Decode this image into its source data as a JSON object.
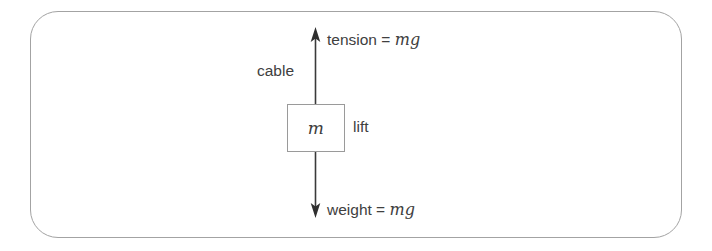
{
  "diagram": {
    "background_color": "#ffffff",
    "frame": {
      "stroke_color": "#a3a3a3",
      "corner_radius": 28
    },
    "body": {
      "shape": "rectangle",
      "mass_symbol": "m",
      "label": "lift",
      "border_color": "#9a9a9a",
      "fill_color": "#ffffff"
    },
    "cable": {
      "label": "cable",
      "line_color": "#3a3a3a"
    },
    "forces": [
      {
        "name": "tension",
        "direction": "up",
        "label": "tension = ",
        "magnitude": "mg",
        "arrow_color": "#3a3a3a"
      },
      {
        "name": "weight",
        "direction": "down",
        "label": "weight = ",
        "magnitude": "mg",
        "arrow_color": "#3a3a3a"
      }
    ]
  }
}
